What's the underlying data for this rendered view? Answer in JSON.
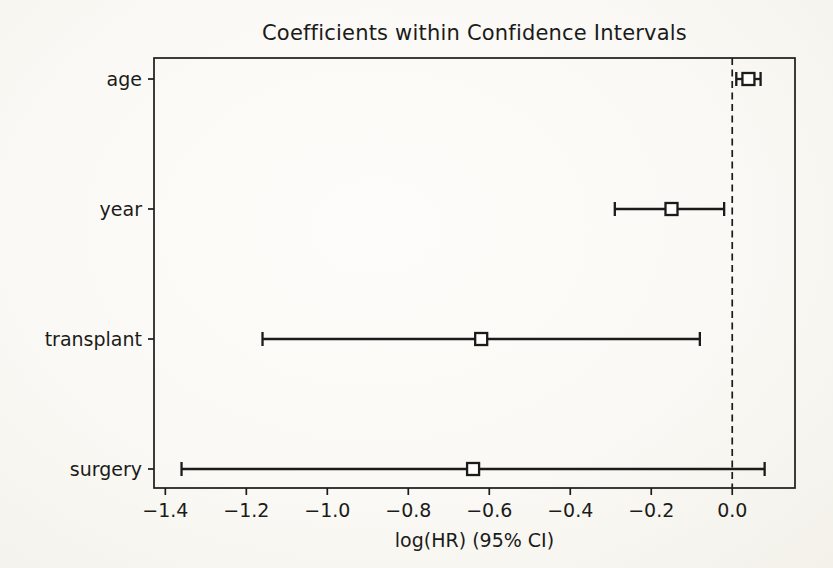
{
  "page": {
    "background": "#faf9f5",
    "ink_color": "#1b1b19",
    "marker_fill": "#ffffff"
  },
  "chart_data": {
    "type": "errorbar",
    "orientation": "horizontal",
    "title": "Coefficients within Confidence Intervals",
    "xlabel": "log(HR) (95% CI)",
    "ylabel": "",
    "grid": false,
    "legend": "none",
    "marker": "open-square",
    "categories": [
      "age",
      "year",
      "transplant",
      "surgery"
    ],
    "series": [
      {
        "name": "age",
        "coef": 0.04,
        "ci_low": 0.01,
        "ci_high": 0.07
      },
      {
        "name": "year",
        "coef": -0.15,
        "ci_low": -0.29,
        "ci_high": -0.02
      },
      {
        "name": "transplant",
        "coef": -0.62,
        "ci_low": -1.16,
        "ci_high": -0.08
      },
      {
        "name": "surgery",
        "coef": -0.64,
        "ci_low": -1.36,
        "ci_high": 0.08
      }
    ],
    "xticks": [
      -1.4,
      -1.2,
      -1.0,
      -0.8,
      -0.6,
      -0.4,
      -0.2,
      0.0
    ],
    "xtick_labels": [
      "−1.4",
      "−1.2",
      "−1.0",
      "−0.8",
      "−0.6",
      "−0.4",
      "−0.2",
      "0.0"
    ],
    "xlim": [
      -1.428,
      0.155
    ],
    "reference_line": {
      "x": 0.0,
      "style": "dashed"
    }
  }
}
